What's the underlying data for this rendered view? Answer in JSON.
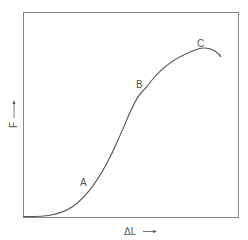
{
  "diagram": {
    "type": "force-extension curve",
    "y_axis": {
      "label": "F",
      "arrow": "up-arrow"
    },
    "x_axis": {
      "label": "ΔL",
      "arrow": "right-arrow"
    },
    "points": [
      {
        "label": "A"
      },
      {
        "label": "B"
      },
      {
        "label": "C"
      }
    ],
    "colors": {
      "line": "#555555",
      "frame": "#777777",
      "background": "#ffffff"
    }
  }
}
